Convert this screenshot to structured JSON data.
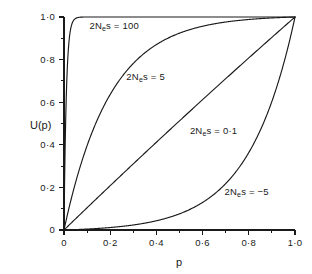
{
  "chart_data": {
    "type": "line",
    "title": "",
    "xlabel": "p",
    "ylabel": "U(p)",
    "xlim": [
      0,
      1
    ],
    "ylim": [
      0,
      1
    ],
    "grid": false,
    "legend_position": "inline-annotations",
    "x_ticks": [
      {
        "value": 0,
        "label": "0"
      },
      {
        "value": 0.2,
        "label": "0·2"
      },
      {
        "value": 0.4,
        "label": "0·4"
      },
      {
        "value": 0.6,
        "label": "0·6"
      },
      {
        "value": 0.8,
        "label": "0·8"
      },
      {
        "value": 1.0,
        "label": "1·0"
      }
    ],
    "y_ticks": [
      {
        "value": 0,
        "label": "0"
      },
      {
        "value": 0.2,
        "label": "0·2"
      },
      {
        "value": 0.4,
        "label": "0·4"
      },
      {
        "value": 0.6,
        "label": "0·6"
      },
      {
        "value": 0.8,
        "label": "0·8"
      },
      {
        "value": 1.0,
        "label": "1·0"
      }
    ],
    "x_minor_ticks": [
      0.1,
      0.3,
      0.5,
      0.7,
      0.9
    ],
    "y_minor_ticks": [
      0.1,
      0.3,
      0.5,
      0.7,
      0.9
    ],
    "formula": "U(p) = (1 - exp(-2Ne*s*p)) / (1 - exp(-2Ne*s))",
    "x": [
      0,
      0.02,
      0.04,
      0.06,
      0.08,
      0.1,
      0.15,
      0.2,
      0.25,
      0.3,
      0.35,
      0.4,
      0.45,
      0.5,
      0.55,
      0.6,
      0.65,
      0.7,
      0.75,
      0.8,
      0.85,
      0.9,
      0.95,
      1.0
    ],
    "series": [
      {
        "name": "2Nes = 100",
        "alpha": 100,
        "label_prefix": "2N",
        "label_sub": "e",
        "label_suffix": "s = 100",
        "label_text": "2Nes = 100",
        "label_x": 0.11,
        "label_y": 0.945,
        "values": [
          0,
          0.865,
          0.982,
          0.998,
          1.0,
          1.0,
          1.0,
          1.0,
          1.0,
          1.0,
          1.0,
          1.0,
          1.0,
          1.0,
          1.0,
          1.0,
          1.0,
          1.0,
          1.0,
          1.0,
          1.0,
          1.0,
          1.0,
          1.0
        ]
      },
      {
        "name": "2Nes = 5",
        "alpha": 5,
        "label_prefix": "2N",
        "label_sub": "e",
        "label_suffix": "s = 5",
        "label_text": "2Nes = 5",
        "label_x": 0.27,
        "label_y": 0.705,
        "values": [
          0,
          0.096,
          0.183,
          0.262,
          0.334,
          0.399,
          0.537,
          0.647,
          0.735,
          0.806,
          0.862,
          0.908,
          0.944,
          0.973,
          0.996,
          1.015,
          1.03,
          1.043,
          1.053,
          1.061,
          1.068,
          1.074,
          1.078,
          1.0
        ]
      },
      {
        "name": "2Nes = 0.1",
        "alpha": 0.1,
        "label_prefix": "2N",
        "label_sub": "e",
        "label_suffix": "s = 0·1",
        "label_text": "2Nes = 0.1",
        "label_x": 0.545,
        "label_y": 0.452,
        "values": [
          0,
          0.0199,
          0.0398,
          0.0597,
          0.0797,
          0.0996,
          0.1496,
          0.1997,
          0.2498,
          0.3,
          0.3502,
          0.4004,
          0.4507,
          0.501,
          0.5513,
          0.6016,
          0.652,
          0.7024,
          0.7528,
          0.8033,
          0.8537,
          0.9042,
          0.9548,
          1.0
        ]
      },
      {
        "name": "2Nes = -5",
        "alpha": -5,
        "label_prefix": "2N",
        "label_sub": "e",
        "label_suffix": "s = −5",
        "label_text": "2Nes = -5",
        "label_x": 0.695,
        "label_y": 0.165,
        "values": [
          0,
          0.0007,
          0.0015,
          0.0023,
          0.0032,
          0.0042,
          0.0071,
          0.0109,
          0.0156,
          0.0217,
          0.0297,
          0.04,
          0.0531,
          0.0701,
          0.0919,
          0.12,
          0.156,
          0.2023,
          0.2617,
          0.338,
          0.436,
          0.562,
          0.724,
          1.0
        ]
      }
    ]
  }
}
